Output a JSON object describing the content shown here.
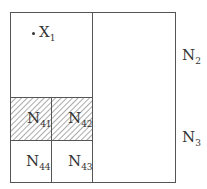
{
  "diagram": {
    "point": {
      "name": "X",
      "sub": "1"
    },
    "regions": [
      {
        "id": "N2",
        "name": "N",
        "sub": "2"
      },
      {
        "id": "N3",
        "name": "N",
        "sub": "3"
      },
      {
        "id": "N41",
        "name": "N",
        "sub": "41",
        "hatched": true
      },
      {
        "id": "N42",
        "name": "N",
        "sub": "42",
        "hatched": true
      },
      {
        "id": "N43",
        "name": "N",
        "sub": "43"
      },
      {
        "id": "N44",
        "name": "N",
        "sub": "44"
      }
    ],
    "colors": {
      "line": "#555555",
      "hatch": "#555555",
      "background": "#ffffff"
    }
  }
}
